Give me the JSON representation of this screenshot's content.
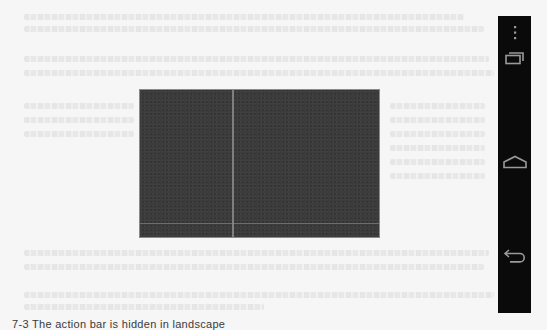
{
  "page": {
    "background_color": "#f6f6f6",
    "bleed_through_text": "illegible"
  },
  "screen": {
    "label": "app-content-area",
    "color": "#3c3c3c"
  },
  "navigation_bar": {
    "color": "#0a0a0a",
    "icon_color": "#9a9a9a",
    "buttons": [
      {
        "name": "overflow-menu",
        "icon": "vertical-ellipsis-icon"
      },
      {
        "name": "recent-apps",
        "icon": "recent-apps-icon"
      },
      {
        "name": "home",
        "icon": "home-icon"
      },
      {
        "name": "back",
        "icon": "back-icon"
      }
    ]
  },
  "caption": {
    "text": "7-3 The action bar is hidden in landscape"
  }
}
